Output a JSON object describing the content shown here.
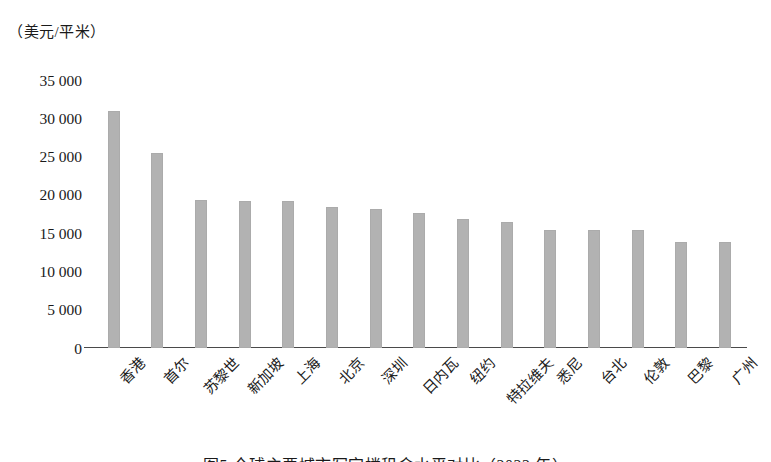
{
  "figure": {
    "unit_label": "（美元/平米）",
    "caption": "图5  全球主要城市写字楼租金水平对比（2022 年）"
  },
  "chart_data": {
    "type": "bar",
    "title": "",
    "xlabel": "",
    "ylabel": "（美元/平米）",
    "ylim": [
      0,
      35000
    ],
    "grid": false,
    "legend": "none",
    "ytick_labels": [
      "35 000",
      "30 000",
      "25 000",
      "20 000",
      "15 000",
      "10 000",
      "5 000",
      "0"
    ],
    "ytick_values": [
      35000,
      30000,
      25000,
      20000,
      15000,
      10000,
      5000,
      0
    ],
    "categories": [
      "香港",
      "首尔",
      "苏黎世",
      "新加坡",
      "上海",
      "北京",
      "深圳",
      "日内瓦",
      "纽约",
      "特拉维夫",
      "悉尼",
      "台北",
      "伦敦",
      "巴黎",
      "广州"
    ],
    "values": [
      31000,
      25500,
      19300,
      19200,
      19200,
      18400,
      18100,
      17600,
      16900,
      16500,
      15400,
      15400,
      15400,
      13800,
      13800
    ],
    "bar_color": "#b2b2b2",
    "axis_color": "#4a4a4a"
  }
}
